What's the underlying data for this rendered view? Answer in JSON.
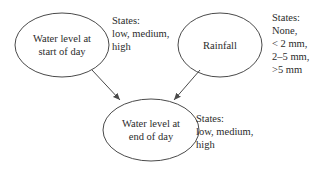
{
  "diagram": {
    "nodes": [
      {
        "id": "water_start",
        "label_lines": [
          "Water level at",
          "start of day"
        ],
        "states_title": "States:",
        "states_lines": [
          "low, medium,",
          "high"
        ]
      },
      {
        "id": "rainfall",
        "label_lines": [
          "Rainfall"
        ],
        "states_title": "States:",
        "states_lines": [
          "None,",
          "< 2 mm,",
          "2–5 mm,",
          ">5 mm"
        ]
      },
      {
        "id": "water_end",
        "label_lines": [
          "Water level at",
          "end of day"
        ],
        "states_title": "States:",
        "states_lines": [
          "low, medium,",
          "high"
        ]
      }
    ],
    "edges": [
      {
        "from": "water_start",
        "to": "water_end"
      },
      {
        "from": "rainfall",
        "to": "water_end"
      }
    ],
    "colors": {
      "stroke": "#4a4a4a",
      "text": "#2b2b2b",
      "background": "#ffffff"
    }
  }
}
